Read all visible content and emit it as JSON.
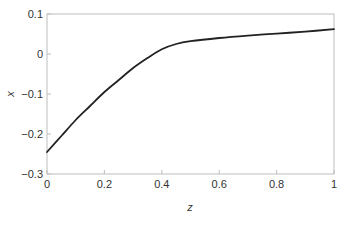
{
  "chart_data": {
    "type": "line",
    "title": "",
    "xlabel": "z",
    "ylabel": "x",
    "xlim": [
      0,
      1
    ],
    "ylim": [
      -0.3,
      0.1
    ],
    "xticks": [
      0,
      0.2,
      0.4,
      0.6,
      0.8,
      1
    ],
    "xtick_labels": [
      "0",
      "0.2",
      "0.4",
      "0.6",
      "0.8",
      "1"
    ],
    "yticks": [
      0.1,
      0,
      -0.1,
      -0.2,
      -0.3
    ],
    "ytick_labels": [
      "0.1",
      "0",
      "−0.1",
      "−0.2",
      "−0.3"
    ],
    "grid": false,
    "legend": null,
    "series": [
      {
        "name": "x(z)",
        "color": "#222222",
        "x": [
          0.0,
          0.05,
          0.1,
          0.15,
          0.2,
          0.25,
          0.3,
          0.35,
          0.4,
          0.45,
          0.5,
          0.6,
          0.7,
          0.8,
          0.9,
          1.0
        ],
        "y": [
          -0.245,
          -0.205,
          -0.165,
          -0.13,
          -0.095,
          -0.065,
          -0.035,
          -0.01,
          0.012,
          0.025,
          0.032,
          0.04,
          0.046,
          0.051,
          0.056,
          0.062
        ]
      }
    ]
  },
  "colors": {
    "axis": "#bdbdbd",
    "line": "#222222",
    "text": "#333333"
  }
}
